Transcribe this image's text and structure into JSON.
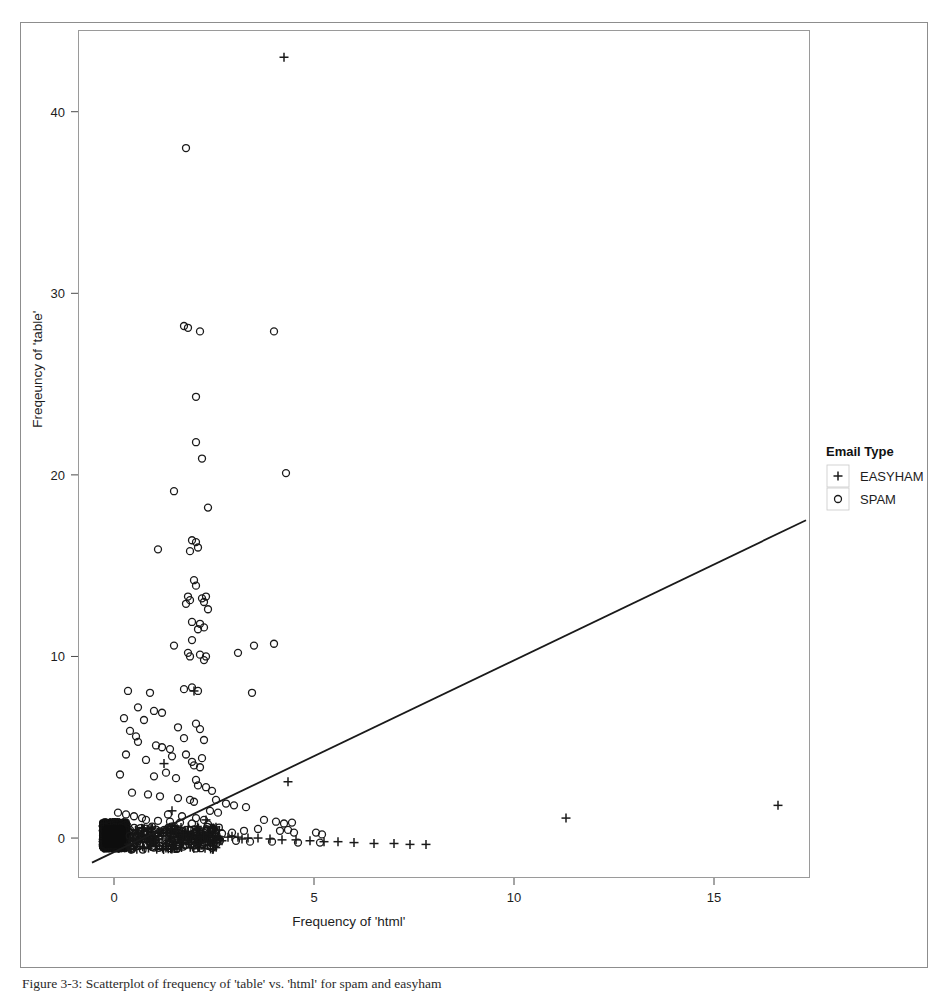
{
  "figure": {
    "caption": "Figure 3-3: Scatterplot of frequency of 'table' vs. 'html' for spam and easyham"
  },
  "legend": {
    "title": "Email Type",
    "position": "right-outside",
    "items": [
      {
        "label": "EASYHAM",
        "marker": "plus"
      },
      {
        "label": "SPAM",
        "marker": "circle"
      }
    ]
  },
  "chart_data": {
    "type": "scatter",
    "title": "",
    "xlabel": "Frequency of 'html'",
    "ylabel": "Freqeuncy of 'table'",
    "xlim": [
      -0.9,
      17.4
    ],
    "ylim": [
      -2.2,
      44.5
    ],
    "xticks": [
      0,
      5,
      10,
      15
    ],
    "yticks": [
      0,
      10,
      20,
      30,
      40
    ],
    "grid": false,
    "series": [
      {
        "name": "EASYHAM",
        "marker": "plus",
        "color": "#1a1a1a",
        "points": [
          [
            4.25,
            43.0
          ],
          [
            2.0,
            8.1
          ],
          [
            1.25,
            4.1
          ],
          [
            4.35,
            3.1
          ],
          [
            11.3,
            1.1
          ],
          [
            16.6,
            1.8
          ],
          [
            2.3,
            1.0
          ],
          [
            1.45,
            1.5
          ],
          [
            0.15,
            0.55
          ],
          [
            0.35,
            0.5
          ],
          [
            0.55,
            0.45
          ],
          [
            0.75,
            0.4
          ],
          [
            0.95,
            0.35
          ],
          [
            1.15,
            0.3
          ],
          [
            1.35,
            0.3
          ],
          [
            1.55,
            0.25
          ],
          [
            1.75,
            0.2
          ],
          [
            1.95,
            0.2
          ],
          [
            2.15,
            0.15
          ],
          [
            2.35,
            0.1
          ],
          [
            2.6,
            0.1
          ],
          [
            2.85,
            0.05
          ],
          [
            3.1,
            0.05
          ],
          [
            3.35,
            0.0
          ],
          [
            3.6,
            0.0
          ],
          [
            3.9,
            -0.05
          ],
          [
            4.2,
            -0.1
          ],
          [
            4.55,
            -0.1
          ],
          [
            4.9,
            -0.15
          ],
          [
            5.25,
            -0.2
          ],
          [
            5.6,
            -0.2
          ],
          [
            6.0,
            -0.25
          ],
          [
            6.5,
            -0.3
          ],
          [
            7.0,
            -0.3
          ],
          [
            7.4,
            -0.35
          ],
          [
            7.8,
            -0.35
          ],
          [
            0.05,
            0.1
          ],
          [
            0.1,
            -0.1
          ],
          [
            0.2,
            0.2
          ],
          [
            0.25,
            -0.2
          ],
          [
            0.3,
            0.15
          ],
          [
            0.4,
            -0.15
          ],
          [
            0.45,
            0.25
          ],
          [
            0.5,
            -0.05
          ],
          [
            0.6,
            0.3
          ],
          [
            0.65,
            -0.25
          ],
          [
            0.7,
            0.1
          ],
          [
            0.8,
            -0.1
          ],
          [
            0.85,
            0.2
          ],
          [
            0.9,
            -0.2
          ],
          [
            1.0,
            0.1
          ],
          [
            1.05,
            -0.15
          ],
          [
            1.1,
            0.25
          ],
          [
            1.2,
            -0.05
          ],
          [
            1.3,
            0.15
          ],
          [
            1.4,
            -0.2
          ],
          [
            1.5,
            0.05
          ],
          [
            1.6,
            -0.1
          ],
          [
            1.7,
            0.2
          ],
          [
            1.8,
            -0.15
          ],
          [
            1.9,
            0.1
          ],
          [
            2.05,
            -0.05
          ],
          [
            2.2,
            0.15
          ],
          [
            2.4,
            -0.1
          ],
          [
            2.5,
            0.05
          ],
          [
            2.7,
            -0.15
          ],
          [
            2.95,
            0.1
          ],
          [
            3.2,
            -0.05
          ]
        ]
      },
      {
        "name": "SPAM",
        "marker": "circle",
        "color": "#1a1a1a",
        "points": [
          [
            1.8,
            38.0
          ],
          [
            1.75,
            28.2
          ],
          [
            1.85,
            28.1
          ],
          [
            2.15,
            27.9
          ],
          [
            4.0,
            27.9
          ],
          [
            2.05,
            24.3
          ],
          [
            2.05,
            21.8
          ],
          [
            2.2,
            20.9
          ],
          [
            4.3,
            20.1
          ],
          [
            2.35,
            18.2
          ],
          [
            1.5,
            19.1
          ],
          [
            1.1,
            15.9
          ],
          [
            1.95,
            16.4
          ],
          [
            2.05,
            16.3
          ],
          [
            2.1,
            16.0
          ],
          [
            1.9,
            15.8
          ],
          [
            2.0,
            14.2
          ],
          [
            2.05,
            13.9
          ],
          [
            1.85,
            13.3
          ],
          [
            1.9,
            13.1
          ],
          [
            2.2,
            13.2
          ],
          [
            2.3,
            13.3
          ],
          [
            2.25,
            13.0
          ],
          [
            2.35,
            12.6
          ],
          [
            1.8,
            12.9
          ],
          [
            1.95,
            11.9
          ],
          [
            2.15,
            11.8
          ],
          [
            2.25,
            11.6
          ],
          [
            2.1,
            11.5
          ],
          [
            1.5,
            10.6
          ],
          [
            1.95,
            10.9
          ],
          [
            1.85,
            10.2
          ],
          [
            1.9,
            10.0
          ],
          [
            2.15,
            10.1
          ],
          [
            2.3,
            10.0
          ],
          [
            2.25,
            9.8
          ],
          [
            3.5,
            10.6
          ],
          [
            4.0,
            10.7
          ],
          [
            3.1,
            10.2
          ],
          [
            3.45,
            8.0
          ],
          [
            0.35,
            8.1
          ],
          [
            0.9,
            8.0
          ],
          [
            1.75,
            8.2
          ],
          [
            1.95,
            8.3
          ],
          [
            2.1,
            8.1
          ],
          [
            0.25,
            6.6
          ],
          [
            0.75,
            6.5
          ],
          [
            0.55,
            5.6
          ],
          [
            0.6,
            5.3
          ],
          [
            1.05,
            5.1
          ],
          [
            1.2,
            5.0
          ],
          [
            0.3,
            4.6
          ],
          [
            1.45,
            4.5
          ],
          [
            1.8,
            4.6
          ],
          [
            1.95,
            4.2
          ],
          [
            2.0,
            4.0
          ],
          [
            2.15,
            3.9
          ],
          [
            2.2,
            4.4
          ],
          [
            1.3,
            3.6
          ],
          [
            0.15,
            3.5
          ],
          [
            1.0,
            3.4
          ],
          [
            1.55,
            3.3
          ],
          [
            2.05,
            3.2
          ],
          [
            2.1,
            2.9
          ],
          [
            2.3,
            2.8
          ],
          [
            2.45,
            2.6
          ],
          [
            0.45,
            2.5
          ],
          [
            0.85,
            2.4
          ],
          [
            1.15,
            2.3
          ],
          [
            1.6,
            2.2
          ],
          [
            1.9,
            2.1
          ],
          [
            2.0,
            2.0
          ],
          [
            2.55,
            2.1
          ],
          [
            2.8,
            1.9
          ],
          [
            3.0,
            1.8
          ],
          [
            3.3,
            1.7
          ],
          [
            2.4,
            1.5
          ],
          [
            2.6,
            1.4
          ],
          [
            1.35,
            1.3
          ],
          [
            1.7,
            1.2
          ],
          [
            2.05,
            1.1
          ],
          [
            2.25,
            1.0
          ],
          [
            3.75,
            1.0
          ],
          [
            4.05,
            0.9
          ],
          [
            4.25,
            0.8
          ],
          [
            4.45,
            0.85
          ],
          [
            4.35,
            0.45
          ],
          [
            4.15,
            0.4
          ],
          [
            4.5,
            0.3
          ],
          [
            5.05,
            0.3
          ],
          [
            5.2,
            0.2
          ],
          [
            3.6,
            0.5
          ],
          [
            3.25,
            0.4
          ],
          [
            2.95,
            0.3
          ],
          [
            2.7,
            0.25
          ],
          [
            2.5,
            0.2
          ],
          [
            0.05,
            0.6
          ],
          [
            0.2,
            0.5
          ],
          [
            0.4,
            0.45
          ],
          [
            0.65,
            0.4
          ],
          [
            0.95,
            0.35
          ],
          [
            1.25,
            0.3
          ],
          [
            1.55,
            0.25
          ],
          [
            1.85,
            0.2
          ],
          [
            2.15,
            0.15
          ],
          [
            0.1,
            1.4
          ],
          [
            0.3,
            1.3
          ],
          [
            0.5,
            1.2
          ],
          [
            0.7,
            1.1
          ],
          [
            0.8,
            1.0
          ],
          [
            1.1,
            0.95
          ],
          [
            1.4,
            0.9
          ],
          [
            1.65,
            0.85
          ],
          [
            1.95,
            0.8
          ],
          [
            2.35,
            0.75
          ],
          [
            0.25,
            0.05
          ],
          [
            0.55,
            0.0
          ],
          [
            0.9,
            -0.05
          ],
          [
            1.3,
            -0.05
          ],
          [
            1.75,
            -0.1
          ],
          [
            2.2,
            -0.1
          ],
          [
            2.65,
            -0.15
          ],
          [
            3.05,
            -0.15
          ],
          [
            3.4,
            -0.2
          ],
          [
            3.95,
            -0.2
          ],
          [
            4.6,
            -0.25
          ],
          [
            5.15,
            -0.25
          ],
          [
            0.6,
            7.2
          ],
          [
            1.0,
            7.0
          ],
          [
            0.4,
            5.9
          ],
          [
            1.6,
            6.1
          ],
          [
            1.2,
            6.9
          ],
          [
            2.05,
            6.3
          ],
          [
            2.15,
            6.0
          ],
          [
            1.75,
            5.5
          ],
          [
            2.25,
            5.4
          ],
          [
            1.4,
            4.9
          ],
          [
            0.8,
            4.3
          ]
        ]
      }
    ],
    "regression_line": {
      "name": "fitted-line",
      "x": [
        -0.55,
        17.3
      ],
      "y": [
        -1.35,
        17.5
      ],
      "color": "#1a1a1a"
    }
  }
}
